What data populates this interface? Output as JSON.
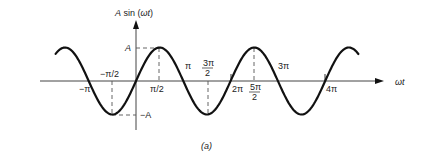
{
  "figure": {
    "caption": "(a)",
    "y_axis_label": "A sin (ωt)",
    "x_axis_label": "ωt",
    "amplitude_label": "A",
    "neg_amplitude_label": "−A"
  },
  "tick_labels": {
    "neg_pi": "−π",
    "neg_half_pi": "−π/2",
    "half_pi": "π/2",
    "pi": "π",
    "three_half_pi_num": "3π",
    "three_half_pi_den": "2",
    "two_pi": "2π",
    "five_half_pi_num": "5π",
    "five_half_pi_den": "2",
    "three_pi": "3π",
    "four_pi": "4π"
  },
  "chart_data": {
    "type": "line",
    "title": "",
    "function": "A sin(ωt)",
    "xlabel": "ωt",
    "ylabel": "A sin (ωt)",
    "x_range_radians": [
      -5.34,
      14.77
    ],
    "ylim": [
      "-A",
      "A"
    ],
    "x_tick_labels": [
      "−π",
      "−π/2",
      "π/2",
      "π",
      "3π/2",
      "2π",
      "5π/2",
      "3π",
      "4π"
    ],
    "y_tick_labels": [
      "A",
      "−A"
    ],
    "dashed_guides": [
      {
        "x": "−π/2",
        "to": "−A"
      },
      {
        "x": "π/2",
        "to": "A"
      },
      {
        "x": "3π/2",
        "to": "−A"
      },
      {
        "x": "5π/2",
        "to": "A"
      }
    ],
    "grid": false,
    "legend": null,
    "series": [
      {
        "name": "A sin(ωt)",
        "amplitude": 1,
        "period": "2π",
        "phase": 0
      }
    ]
  }
}
